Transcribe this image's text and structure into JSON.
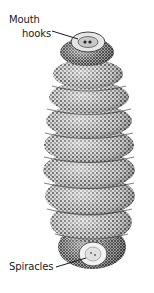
{
  "figure": {
    "colors": {
      "background": "#ffffff",
      "ink": "#1a1a1a",
      "body_mid": "#8a8a8a",
      "body_light": "#d9d9d9",
      "body_dark": "#3a3a3a"
    },
    "labels": [
      {
        "text": "Mouth",
        "part": "mouth-hooks"
      },
      {
        "text": "hooks",
        "part": "mouth-hooks"
      },
      {
        "text": "Spiracles",
        "part": "spiracles"
      }
    ],
    "segments": 8
  }
}
